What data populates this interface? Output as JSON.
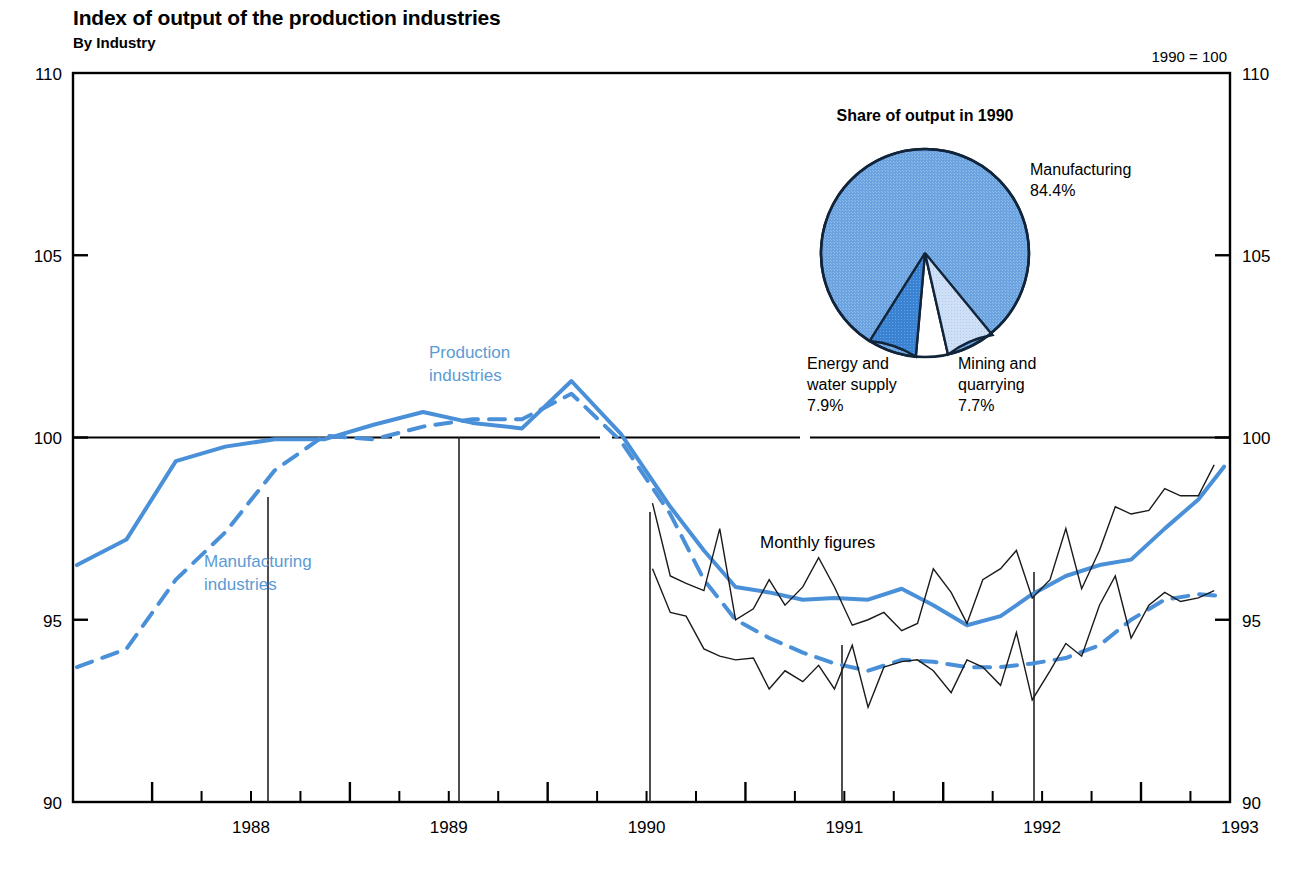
{
  "header": {
    "title": "Index of output of the production industries",
    "subtitle": "By Industry",
    "base_note": "1990 = 100"
  },
  "annotations": {
    "production_industries": "Production",
    "production_industries_2": "industries",
    "manufacturing_industries": "Manufacturing",
    "manufacturing_industries_2": "industries",
    "monthly_figures": "Monthly figures"
  },
  "pie": {
    "title": "Share of output in 1990",
    "labels": {
      "manufacturing_name": "Manufacturing",
      "manufacturing_value": "84.4%",
      "energy_name": "Energy and",
      "energy_name_2": "water supply",
      "energy_value": "7.9%",
      "mining_name": "Mining and",
      "mining_name_2": "quarrying",
      "mining_value": "7.7%"
    }
  },
  "colors": {
    "series_blue": "#4a90d9",
    "pie_main": "#6aa3e0",
    "pie_energy": "#3a82d2",
    "pie_mining": "#c9ddf4",
    "axis": "#000000",
    "monthly": "#1a1a1a"
  },
  "chart_data": {
    "type": "line",
    "title": "Index of output of the production industries",
    "subtitle": "By Industry",
    "xlabel": "",
    "ylabel": "",
    "base_note": "1990 = 100",
    "ylim": [
      90,
      110
    ],
    "yticks": [
      90,
      95,
      100,
      105,
      110
    ],
    "ytick_labels": [
      "90",
      "95",
      "100",
      "105",
      "110"
    ],
    "y_axis_both_sides": true,
    "xlim": [
      1987.6,
      1993.45
    ],
    "xtick_years": [
      1988,
      1989,
      1990,
      1991,
      1992,
      1993
    ],
    "xtick_labels": [
      "1988",
      "1989",
      "1990",
      "1991",
      "1992",
      "1993"
    ],
    "xticks_minor": "quarterly",
    "grid": false,
    "reference_line": {
      "value": 100,
      "style": "solid-segmented"
    },
    "legend": "inline-labels",
    "series": [
      {
        "name": "Production industries",
        "style": "solid",
        "color": "#4a90d9",
        "width": 4,
        "x": [
          1987.62,
          1987.87,
          1988.12,
          1988.37,
          1988.62,
          1988.87,
          1989.12,
          1989.37,
          1989.62,
          1989.87,
          1990.12,
          1990.37,
          1990.62,
          1990.79,
          1990.95,
          1991.12,
          1991.29,
          1991.45,
          1991.62,
          1991.79,
          1991.95,
          1992.12,
          1992.29,
          1992.45,
          1992.62,
          1992.79,
          1992.95,
          1993.12,
          1993.29,
          1993.42
        ],
        "y": [
          96.5,
          97.2,
          99.35,
          99.75,
          99.95,
          99.95,
          100.35,
          100.7,
          100.4,
          100.25,
          101.55,
          100.1,
          98.1,
          96.9,
          95.9,
          95.75,
          95.55,
          95.6,
          95.55,
          95.85,
          95.4,
          94.85,
          95.1,
          95.7,
          96.2,
          96.5,
          96.65,
          97.5,
          98.3,
          99.2
        ]
      },
      {
        "name": "Manufacturing industries",
        "style": "dashed",
        "color": "#4a90d9",
        "width": 4,
        "x": [
          1987.62,
          1987.87,
          1988.12,
          1988.37,
          1988.62,
          1988.87,
          1989.12,
          1989.37,
          1989.62,
          1989.87,
          1990.12,
          1990.37,
          1990.62,
          1990.79,
          1990.95,
          1991.12,
          1991.29,
          1991.45,
          1991.62,
          1991.79,
          1991.95,
          1992.12,
          1992.29,
          1992.45,
          1992.62,
          1992.79,
          1992.95,
          1993.12,
          1993.29,
          1993.42
        ],
        "y": [
          93.7,
          94.2,
          96.1,
          97.4,
          99.1,
          100.05,
          99.95,
          100.3,
          100.5,
          100.5,
          101.2,
          99.9,
          97.9,
          96.1,
          95.0,
          94.5,
          94.1,
          93.8,
          93.6,
          93.9,
          93.85,
          93.7,
          93.7,
          93.8,
          93.95,
          94.3,
          95.0,
          95.55,
          95.7,
          95.65
        ]
      },
      {
        "name": "Monthly figures - production industries",
        "style": "thin-solid",
        "color": "#1a1a1a",
        "width": 1.4,
        "x": [
          1990.53,
          1990.62,
          1990.7,
          1990.79,
          1990.87,
          1990.95,
          1991.04,
          1991.12,
          1991.2,
          1991.29,
          1991.37,
          1991.45,
          1991.54,
          1991.62,
          1991.7,
          1991.79,
          1991.87,
          1991.95,
          1992.04,
          1992.12,
          1992.2,
          1992.29,
          1992.37,
          1992.45,
          1992.54,
          1992.62,
          1992.7,
          1992.79,
          1992.87,
          1992.95,
          1993.04,
          1993.12,
          1993.2,
          1993.29,
          1993.37
        ],
        "y": [
          98.2,
          96.2,
          96.0,
          95.8,
          97.5,
          95.0,
          95.3,
          96.1,
          95.4,
          95.9,
          96.7,
          95.9,
          94.85,
          95.0,
          95.2,
          94.7,
          94.9,
          96.4,
          95.75,
          94.9,
          96.1,
          96.4,
          96.9,
          95.6,
          96.1,
          97.5,
          95.85,
          96.9,
          98.1,
          97.9,
          98.0,
          98.6,
          98.4,
          98.4,
          99.25
        ]
      },
      {
        "name": "Monthly figures - manufacturing industries",
        "style": "thin-solid",
        "color": "#1a1a1a",
        "width": 1.4,
        "x": [
          1990.53,
          1990.62,
          1990.7,
          1990.79,
          1990.87,
          1990.95,
          1991.04,
          1991.12,
          1991.2,
          1991.29,
          1991.37,
          1991.45,
          1991.54,
          1991.62,
          1991.7,
          1991.79,
          1991.87,
          1991.95,
          1992.04,
          1992.12,
          1992.2,
          1992.29,
          1992.37,
          1992.45,
          1992.54,
          1992.62,
          1992.7,
          1992.79,
          1992.87,
          1992.95,
          1993.04,
          1993.12,
          1993.2,
          1993.29,
          1993.37
        ],
        "y": [
          96.4,
          95.2,
          95.1,
          94.2,
          94.0,
          93.9,
          93.95,
          93.1,
          93.6,
          93.3,
          93.75,
          93.1,
          94.3,
          92.6,
          93.7,
          93.85,
          93.9,
          93.6,
          93.0,
          93.9,
          93.7,
          93.2,
          94.65,
          92.8,
          93.6,
          94.35,
          94.0,
          95.4,
          96.2,
          94.5,
          95.4,
          95.75,
          95.5,
          95.6,
          95.8
        ]
      }
    ],
    "pie_inset": {
      "type": "pie",
      "title": "Share of output in 1990",
      "labels": [
        "Manufacturing",
        "Energy and water supply",
        "Mining and quarrying"
      ],
      "values": [
        84.4,
        7.9,
        7.7
      ],
      "colors": [
        "#6aa3e0",
        "#3a82d2",
        "#c9ddf4"
      ]
    }
  }
}
